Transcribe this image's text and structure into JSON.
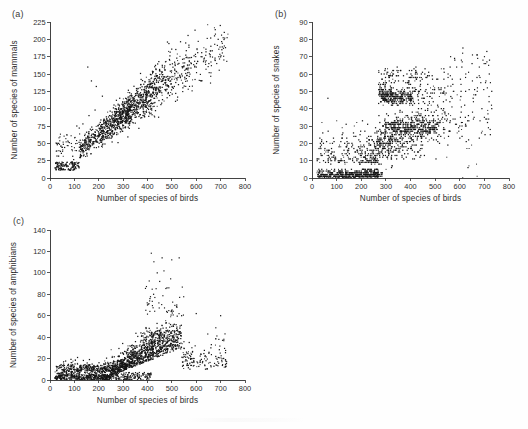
{
  "figure": {
    "title": "",
    "background_color": "#fefefe",
    "point_color": "#151515",
    "axis_color": "#2e2e2e",
    "width": 528,
    "height": 429
  },
  "panels": [
    {
      "label": "(a)",
      "name": "panel-mammals",
      "chart_ref": 0
    },
    {
      "label": "(b)",
      "name": "panel-snakes",
      "chart_ref": 1
    },
    {
      "label": "(c)",
      "name": "panel-amphibians",
      "chart_ref": 2
    }
  ],
  "chart_data": [
    {
      "type": "scatter",
      "panel": "(a)",
      "title": "",
      "xlabel": "Number of species of birds",
      "ylabel": "Number of species of mammals",
      "xlim": [
        0,
        800
      ],
      "ylim": [
        0,
        225
      ],
      "xticks": [
        0,
        100,
        200,
        300,
        400,
        500,
        600,
        700,
        800
      ],
      "yticks": [
        0,
        25,
        50,
        75,
        100,
        125,
        150,
        175,
        200,
        225
      ],
      "grid": false,
      "legend": "none",
      "n_points": 1400,
      "relationship": "strong positive, near-linear; mammals rise from about 12 at 30 birds to about 200 at 700 birds",
      "description": "Dense elongated cloud along a rising trend with scatter widening in the middle range; a few high outliers near 50 mammals at low bird counts.",
      "trend": {
        "slope": 0.285,
        "intercept": 5,
        "spread_low": 4,
        "spread_high": 22
      },
      "x_distribution": {
        "mode": 330,
        "min": 20,
        "max": 730
      },
      "sample_points": [
        [
          25,
          12
        ],
        [
          40,
          14
        ],
        [
          55,
          13
        ],
        [
          70,
          18
        ],
        [
          85,
          22
        ],
        [
          95,
          16
        ],
        [
          30,
          48
        ],
        [
          35,
          50
        ],
        [
          45,
          46
        ],
        [
          60,
          44
        ],
        [
          75,
          52
        ],
        [
          110,
          75
        ],
        [
          120,
          72
        ],
        [
          135,
          78
        ],
        [
          150,
          66
        ],
        [
          160,
          90
        ],
        [
          175,
          70
        ],
        [
          185,
          98
        ],
        [
          200,
          65
        ],
        [
          210,
          72
        ],
        [
          225,
          80
        ],
        [
          240,
          88
        ],
        [
          255,
          95
        ],
        [
          270,
          100
        ],
        [
          285,
          105
        ],
        [
          300,
          98
        ],
        [
          315,
          110
        ],
        [
          330,
          102
        ],
        [
          345,
          115
        ],
        [
          360,
          108
        ],
        [
          375,
          120
        ],
        [
          390,
          112
        ],
        [
          405,
          125
        ],
        [
          420,
          118
        ],
        [
          435,
          130
        ],
        [
          450,
          124
        ],
        [
          465,
          135
        ],
        [
          480,
          128
        ],
        [
          495,
          140
        ],
        [
          510,
          132
        ],
        [
          525,
          145
        ],
        [
          540,
          150
        ],
        [
          560,
          158
        ],
        [
          580,
          165
        ],
        [
          600,
          160
        ],
        [
          620,
          175
        ],
        [
          640,
          182
        ],
        [
          660,
          190
        ],
        [
          675,
          205
        ],
        [
          690,
          200
        ],
        [
          705,
          185
        ],
        [
          715,
          210
        ],
        [
          720,
          188
        ],
        [
          170,
          140
        ],
        [
          190,
          132
        ],
        [
          155,
          160
        ],
        [
          215,
          118
        ],
        [
          265,
          90
        ]
      ]
    },
    {
      "type": "scatter",
      "panel": "(b)",
      "title": "",
      "xlabel": "Number of species of birds",
      "ylabel": "Number of species of snakes",
      "xlim": [
        0,
        800
      ],
      "ylim": [
        0,
        90
      ],
      "xticks": [
        0,
        100,
        200,
        300,
        400,
        500,
        600,
        700,
        800
      ],
      "yticks": [
        0,
        10,
        20,
        30,
        40,
        50,
        60,
        70,
        80,
        90
      ],
      "grid": false,
      "legend": "none",
      "n_points": 1400,
      "relationship": "positive but noisier; strong horizontal banding from integer snake counts",
      "description": "Points form distinct horizontal bands (integer counts). Large mass near 0-5 snakes for birds below 300, rising band structure 15-50 snakes between 250 and 520 birds, sparse scattered points at high bird counts.",
      "trend": {
        "slope": 0.085,
        "intercept": -2,
        "spread_low": 3,
        "spread_high": 14
      },
      "x_distribution": {
        "mode": 330,
        "min": 20,
        "max": 730
      },
      "sample_points": [
        [
          30,
          1
        ],
        [
          45,
          2
        ],
        [
          60,
          1
        ],
        [
          80,
          3
        ],
        [
          100,
          2
        ],
        [
          120,
          4
        ],
        [
          140,
          2
        ],
        [
          160,
          3
        ],
        [
          180,
          1
        ],
        [
          200,
          2
        ],
        [
          220,
          3
        ],
        [
          240,
          2
        ],
        [
          55,
          9
        ],
        [
          70,
          12
        ],
        [
          90,
          15
        ],
        [
          110,
          18
        ],
        [
          130,
          16
        ],
        [
          150,
          20
        ],
        [
          170,
          17
        ],
        [
          190,
          22
        ],
        [
          210,
          19
        ],
        [
          230,
          24
        ],
        [
          250,
          21
        ],
        [
          270,
          27
        ],
        [
          290,
          45
        ],
        [
          300,
          47
        ],
        [
          310,
          46
        ],
        [
          320,
          48
        ],
        [
          335,
          44
        ],
        [
          350,
          50
        ],
        [
          290,
          30
        ],
        [
          310,
          31
        ],
        [
          330,
          29
        ],
        [
          350,
          33
        ],
        [
          370,
          30
        ],
        [
          390,
          35
        ],
        [
          410,
          32
        ],
        [
          430,
          38
        ],
        [
          450,
          34
        ],
        [
          470,
          40
        ],
        [
          490,
          36
        ],
        [
          510,
          42
        ],
        [
          360,
          62
        ],
        [
          400,
          58
        ],
        [
          420,
          60
        ],
        [
          440,
          56
        ],
        [
          470,
          54
        ],
        [
          540,
          38
        ],
        [
          560,
          44
        ],
        [
          580,
          68
        ],
        [
          600,
          30
        ],
        [
          620,
          42
        ],
        [
          650,
          66
        ],
        [
          670,
          58
        ],
        [
          690,
          40
        ],
        [
          710,
          73
        ],
        [
          720,
          60
        ],
        [
          730,
          40
        ]
      ]
    },
    {
      "type": "scatter",
      "panel": "(c)",
      "title": "",
      "xlabel": "Number of species of birds",
      "ylabel": "Number of species of amphibians",
      "xlim": [
        0,
        800
      ],
      "ylim": [
        0,
        140
      ],
      "xticks": [
        0,
        100,
        200,
        300,
        400,
        500,
        600,
        700,
        800
      ],
      "yticks": [
        0,
        20,
        40,
        60,
        80,
        100,
        120,
        140
      ],
      "grid": false,
      "legend": "none",
      "n_points": 1400,
      "relationship": "weak to moderate positive with strong right skew; a long low band near zero plus a fan of high values between 380 and 520 birds",
      "description": "Most points lie below 20 amphibians. A dense rising plume between 250 and 520 birds reaches 40-60, with sparse outliers up to about 115 near 430-530 birds.",
      "trend": {
        "slope": 0.055,
        "intercept": -5,
        "spread_low": 3,
        "spread_high": 18
      },
      "x_distribution": {
        "mode": 340,
        "min": 20,
        "max": 720
      },
      "sample_points": [
        [
          30,
          3
        ],
        [
          50,
          5
        ],
        [
          70,
          9
        ],
        [
          90,
          11
        ],
        [
          110,
          10
        ],
        [
          130,
          12
        ],
        [
          150,
          13
        ],
        [
          170,
          11
        ],
        [
          190,
          9
        ],
        [
          210,
          8
        ],
        [
          230,
          10
        ],
        [
          250,
          12
        ],
        [
          270,
          15
        ],
        [
          290,
          18
        ],
        [
          310,
          20
        ],
        [
          330,
          24
        ],
        [
          350,
          22
        ],
        [
          370,
          28
        ],
        [
          390,
          30
        ],
        [
          410,
          34
        ],
        [
          430,
          36
        ],
        [
          450,
          40
        ],
        [
          470,
          42
        ],
        [
          490,
          46
        ],
        [
          500,
          50
        ],
        [
          510,
          52
        ],
        [
          520,
          48
        ],
        [
          530,
          44
        ],
        [
          400,
          70
        ],
        [
          410,
          76
        ],
        [
          425,
          80
        ],
        [
          440,
          100
        ],
        [
          450,
          92
        ],
        [
          460,
          114
        ],
        [
          480,
          86
        ],
        [
          520,
          70
        ],
        [
          530,
          114
        ],
        [
          540,
          60
        ],
        [
          560,
          26
        ],
        [
          580,
          20
        ],
        [
          600,
          62
        ],
        [
          620,
          24
        ],
        [
          640,
          18
        ],
        [
          660,
          30
        ],
        [
          680,
          22
        ],
        [
          700,
          60
        ],
        [
          710,
          20
        ],
        [
          280,
          6
        ],
        [
          300,
          5
        ],
        [
          330,
          4
        ],
        [
          360,
          6
        ],
        [
          390,
          3
        ]
      ]
    }
  ]
}
